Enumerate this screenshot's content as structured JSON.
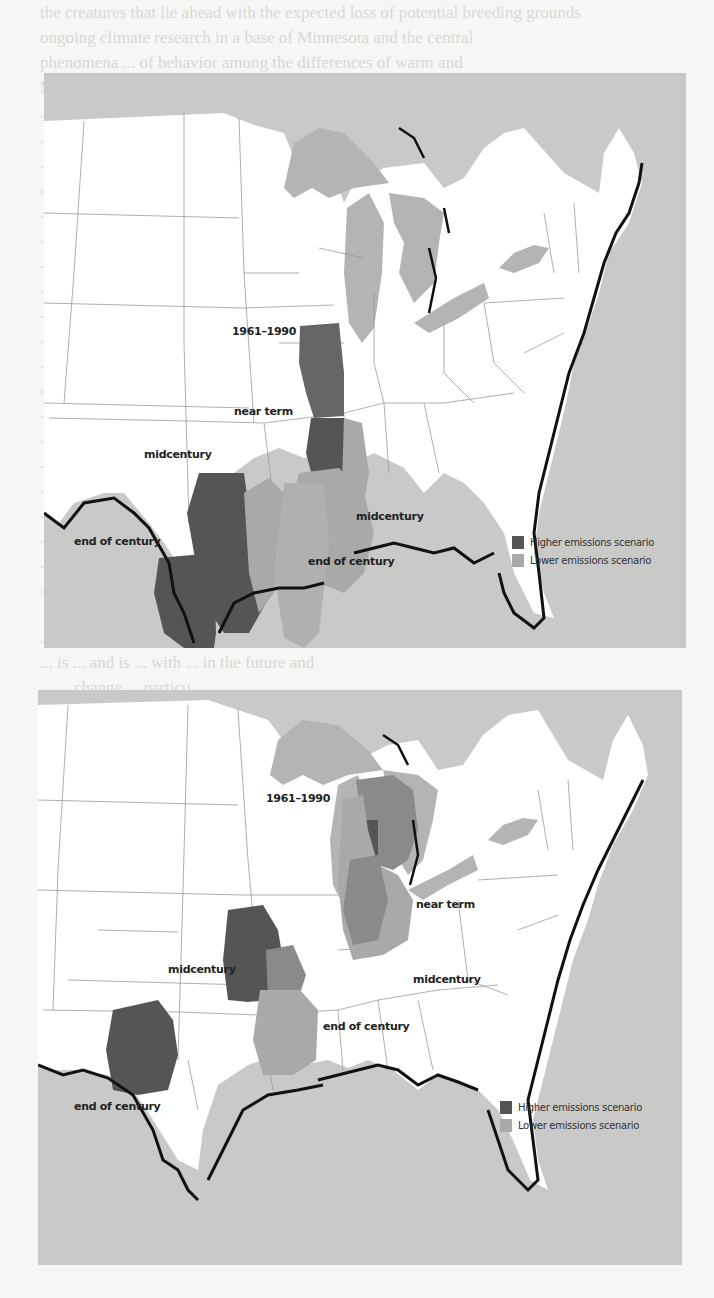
{
  "page": {
    "background_text_lines": [
      "the creatures that lie ahead with the expected loss of potential breeding grounds",
      "ongoing climate research in a base of Minnesota and the central",
      "phenomena ... of behavior among the differences of warm and",
      "Mexico ... the case of the northern the observed changes",
      "... winter in moderate ... will continue regardless of",
      "... that ... at ... of the ... which had sustained the",
      "... in the the end, the ... world's changes",
      "... in some ... which ... the top",
      "... exams... consequences of ... a climatic change is",
      "... been ... generally called ... 1850 and ... in",
      "... and which ... Alaska ... pack roads and to",
      "... exam ... most ... and wildlife they de",
      "... ... ... are fa",
      "... migration ... ... ... this ha",
      "... the ... ... had ... eaten",
      "... ... ... and ... 586",
      "... ... ... ... ... ... safe ... of",
      "... had hunted safely for twenty years ... ice-flexed ...",
      "... started ... the ... with and ... or",
      "... these ... switched ... in B",
      "... the ... for ... ord",
      "... ... ... ... ... commented ... the",
      "... ... ... ... cannot pass on their",
      "... knowledge ... ... chapter.",
      "",
      "... verse",
      "... is ... and is ... with ... in the future and",
      "... ... change ... particu",
      "... ... ... ... ... development of natural habitats",
      "... ... loss and fragmentation as the human",
      "... ... species and direct",
      "... production ... and ... ...",
      "",
      "... from Heat and Cold",
      "... and others ... worried",
      "... warming ... causes deaths from heat wav",
      "... The ..."
    ]
  },
  "maps": [
    {
      "id": "illinois",
      "labels": {
        "baseline": "1961–1990",
        "near_term": "near term",
        "midcentury_high": "midcentury",
        "midcentury_low": "midcentury",
        "end_of_century_high": "end of century",
        "end_of_century_low": "end of century"
      },
      "legend": {
        "higher": "Higher emissions scenario",
        "lower": "Lower emissions scenario"
      }
    },
    {
      "id": "michigan",
      "labels": {
        "baseline": "1961–1990",
        "near_term": "near term",
        "midcentury_high": "midcentury",
        "midcentury_low": "midcentury",
        "end_of_century_high": "end of century",
        "end_of_century_low": "end of century"
      },
      "legend": {
        "higher": "Higher emissions scenario",
        "lower": "Lower emissions scenario"
      }
    }
  ],
  "colors": {
    "ocean": "#c9c9c7",
    "land": "#ffffff",
    "lakes": "#b4b4b2",
    "higher_emissions": "#555555",
    "lower_emissions": "#a9a9a7",
    "overlap": "#7b7b7b",
    "coast": "#111111",
    "borders": "#9a9a9a"
  }
}
